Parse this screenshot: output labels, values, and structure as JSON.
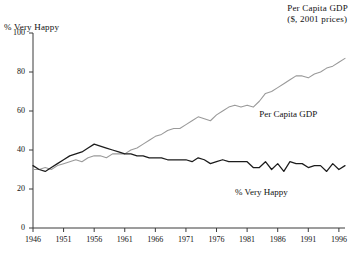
{
  "chart_data": {
    "type": "line",
    "title": "",
    "corner_title_line1": "Per Capita GDP",
    "corner_title_line2": "($, 2001 prices)",
    "ylabel": "% Very Happy",
    "xlabel": "",
    "ylim": [
      0,
      100
    ],
    "xlim": [
      1946,
      1997
    ],
    "yticks": [
      0,
      20,
      40,
      60,
      80,
      100
    ],
    "ytick_labels": [
      "0",
      "20",
      "40",
      "60",
      "80",
      "100"
    ],
    "xticks": [
      1946,
      1951,
      1956,
      1961,
      1966,
      1971,
      1976,
      1981,
      1986,
      1991,
      1996
    ],
    "xtick_labels": [
      "1946",
      "1951",
      "1956",
      "1961",
      "1966",
      "1971",
      "1976",
      "1981",
      "1986",
      "1991",
      "1996"
    ],
    "grid": false,
    "legend": "inline-annotations",
    "annotations": [
      {
        "text": "Per Capita GDP",
        "x": 1983,
        "y": 58
      },
      {
        "text": "% Very Happy",
        "x": 1979,
        "y": 18
      }
    ],
    "series": [
      {
        "name": "Per Capita GDP",
        "color": "#9a9a9a",
        "x": [
          1946,
          1947,
          1948,
          1949,
          1950,
          1951,
          1952,
          1953,
          1954,
          1955,
          1956,
          1957,
          1958,
          1959,
          1960,
          1961,
          1962,
          1963,
          1964,
          1965,
          1966,
          1967,
          1968,
          1969,
          1970,
          1971,
          1972,
          1973,
          1974,
          1975,
          1976,
          1977,
          1978,
          1979,
          1980,
          1981,
          1982,
          1983,
          1984,
          1985,
          1986,
          1987,
          1988,
          1989,
          1990,
          1991,
          1992,
          1993,
          1994,
          1995,
          1996,
          1997
        ],
        "values": [
          30,
          30,
          31,
          30,
          32,
          33,
          34,
          35,
          34,
          36,
          37,
          37,
          36,
          38,
          38,
          38,
          40,
          41,
          43,
          45,
          47,
          48,
          50,
          51,
          51,
          53,
          55,
          57,
          56,
          55,
          58,
          60,
          62,
          63,
          62,
          63,
          62,
          65,
          69,
          70,
          72,
          74,
          76,
          78,
          78,
          77,
          79,
          80,
          82,
          83,
          85,
          87
        ]
      },
      {
        "name": "% Very Happy",
        "color": "#1c1c1c",
        "x": [
          1946,
          1947,
          1948,
          1949,
          1950,
          1951,
          1952,
          1953,
          1954,
          1955,
          1956,
          1957,
          1958,
          1959,
          1960,
          1961,
          1962,
          1963,
          1964,
          1965,
          1966,
          1967,
          1968,
          1969,
          1970,
          1971,
          1972,
          1973,
          1974,
          1975,
          1976,
          1977,
          1978,
          1979,
          1980,
          1981,
          1982,
          1983,
          1984,
          1985,
          1986,
          1987,
          1988,
          1989,
          1990,
          1991,
          1992,
          1993,
          1994,
          1995,
          1996,
          1997
        ],
        "values": [
          32,
          30,
          29,
          31,
          33,
          35,
          37,
          38,
          39,
          41,
          43,
          42,
          41,
          40,
          39,
          38,
          38,
          37,
          37,
          36,
          36,
          36,
          35,
          35,
          35,
          35,
          34,
          36,
          35,
          33,
          34,
          35,
          34,
          34,
          34,
          34,
          31,
          31,
          34,
          30,
          33,
          29,
          34,
          33,
          33,
          31,
          32,
          32,
          29,
          33,
          30,
          32
        ]
      }
    ]
  }
}
